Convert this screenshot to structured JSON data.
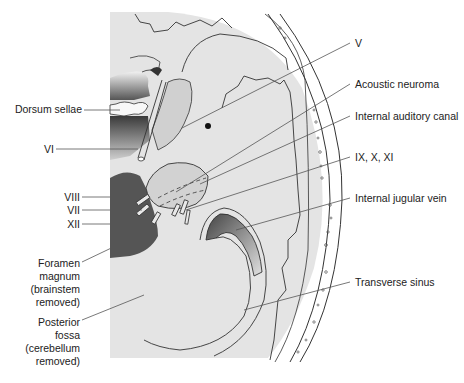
{
  "figure": {
    "type": "anatomical-diagram",
    "colors": {
      "background": "#ffffff",
      "fossa_fill": "#e4e4e4",
      "dark_structure": "#555555",
      "tumor_fill": "#d2d2d2",
      "line": "#333333",
      "label_text": "#222222"
    }
  },
  "labels_left": [
    {
      "id": "dorsum-sellae",
      "text": "Dorsum sellae"
    },
    {
      "id": "cn-vi",
      "text": "VI"
    },
    {
      "id": "cn-viii",
      "text": "VIII"
    },
    {
      "id": "cn-vii",
      "text": "VII"
    },
    {
      "id": "cn-xii",
      "text": "XII"
    },
    {
      "id": "foramen-magnum",
      "text": "Foramen\nmagnum\n(brainstem\nremoved)"
    },
    {
      "id": "posterior-fossa",
      "text": "Posterior\nfossa\n(cerebellum\nremoved)"
    }
  ],
  "labels_right": [
    {
      "id": "cn-v",
      "text": "V"
    },
    {
      "id": "acoustic-neuroma",
      "text": "Acoustic neuroma"
    },
    {
      "id": "internal-auditory-canal",
      "text": "Internal auditory canal"
    },
    {
      "id": "cn-ix-x-xi",
      "text": "IX, X, XI"
    },
    {
      "id": "internal-jugular-vein",
      "text": "Internal jugular vein"
    },
    {
      "id": "transverse-sinus",
      "text": "Transverse sinus"
    }
  ]
}
